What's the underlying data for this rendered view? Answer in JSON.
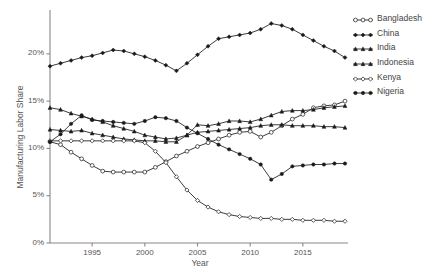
{
  "chart_data": {
    "type": "line",
    "title": "",
    "xlabel": "Year",
    "ylabel": "Manufacturing Labor Share",
    "xlim": [
      1991,
      2019
    ],
    "ylim": [
      0,
      24
    ],
    "grid": false,
    "legend_position": "right-outside",
    "ytick_labels": [
      "0%",
      "5%",
      "10%",
      "15%",
      "20%"
    ],
    "ytick_values": [
      0,
      5,
      10,
      15,
      20
    ],
    "xtick_labels": [
      "1995",
      "2000",
      "2005",
      "2010",
      "2015"
    ],
    "xtick_values": [
      1995,
      2000,
      2005,
      2010,
      2015
    ],
    "x": [
      1991,
      1992,
      1993,
      1994,
      1995,
      1996,
      1997,
      1998,
      1999,
      2000,
      2001,
      2002,
      2003,
      2004,
      2005,
      2006,
      2007,
      2008,
      2009,
      2010,
      2011,
      2012,
      2013,
      2014,
      2015,
      2016,
      2017,
      2018,
      2019
    ],
    "series": [
      {
        "name": "Bangladesh",
        "marker": "open-circle",
        "values": [
          10.7,
          10.4,
          9.6,
          8.9,
          8.2,
          7.6,
          7.5,
          7.5,
          7.5,
          7.5,
          8.0,
          8.6,
          9.2,
          9.7,
          10.2,
          10.6,
          11.0,
          11.4,
          11.7,
          11.8,
          11.2,
          11.7,
          12.4,
          13.1,
          13.6,
          14.3,
          14.5,
          14.6,
          15.0
        ]
      },
      {
        "name": "China",
        "marker": "filled-diamond",
        "values": [
          18.7,
          19.0,
          19.3,
          19.6,
          19.8,
          20.1,
          20.4,
          20.3,
          20.0,
          19.7,
          19.3,
          18.8,
          18.2,
          19.0,
          19.9,
          20.8,
          21.6,
          21.8,
          22.0,
          22.2,
          22.6,
          23.2,
          23.0,
          22.6,
          22.0,
          21.4,
          20.8,
          20.3,
          19.6
        ]
      },
      {
        "name": "India",
        "marker": "filled-triangle",
        "values": [
          14.3,
          14.1,
          13.7,
          13.4,
          13.1,
          12.8,
          12.4,
          12.1,
          11.8,
          11.4,
          11.2,
          11.0,
          11.1,
          11.4,
          11.7,
          11.8,
          11.9,
          12.0,
          12.1,
          12.2,
          12.4,
          12.5,
          12.5,
          12.4,
          12.4,
          12.4,
          12.3,
          12.3,
          12.2
        ]
      },
      {
        "name": "Indonesia",
        "marker": "filled-triangle-up",
        "values": [
          12.0,
          11.9,
          11.8,
          11.9,
          11.6,
          11.4,
          11.2,
          11.0,
          10.9,
          10.8,
          10.8,
          10.7,
          10.7,
          11.4,
          12.5,
          12.4,
          12.6,
          12.9,
          12.9,
          12.8,
          13.1,
          13.5,
          13.9,
          14.0,
          14.0,
          14.1,
          14.3,
          14.4,
          14.5
        ]
      },
      {
        "name": "Kenya",
        "marker": "open-diamond",
        "values": [
          10.8,
          10.8,
          10.8,
          10.8,
          10.8,
          10.8,
          10.8,
          10.8,
          10.8,
          10.6,
          9.7,
          8.5,
          7.0,
          5.6,
          4.5,
          3.8,
          3.3,
          3.0,
          2.8,
          2.7,
          2.6,
          2.6,
          2.5,
          2.5,
          2.4,
          2.4,
          2.4,
          2.3,
          2.3
        ]
      },
      {
        "name": "Nigeria",
        "marker": "filled-circle",
        "values": [
          10.7,
          11.5,
          12.6,
          13.5,
          13.0,
          12.9,
          12.8,
          12.7,
          12.6,
          12.9,
          13.3,
          13.2,
          12.9,
          12.2,
          11.6,
          11.0,
          10.4,
          9.9,
          9.4,
          8.9,
          8.3,
          6.7,
          7.3,
          8.1,
          8.2,
          8.3,
          8.3,
          8.4,
          8.4
        ]
      }
    ]
  },
  "legend": {
    "items": [
      {
        "label": "Bangladesh"
      },
      {
        "label": "China"
      },
      {
        "label": "India"
      },
      {
        "label": "Indonesia"
      },
      {
        "label": "Kenya"
      },
      {
        "label": "Nigeria"
      }
    ]
  },
  "colors": {
    "line": "#1a1a1a",
    "open_marker_fill": "#ffffff",
    "axis": "#888888",
    "text": "#555555"
  }
}
